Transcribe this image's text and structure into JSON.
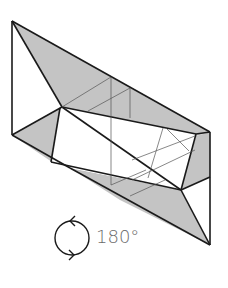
{
  "diagram": {
    "type": "origami-fold-step",
    "colors": {
      "paper_back": "#c4c4c4",
      "paper_front": "#ffffff",
      "line": "#1a1a1a",
      "thin_line": "#555555"
    }
  },
  "instruction": {
    "icon": "rotate-icon",
    "rotation_label": "180°"
  }
}
